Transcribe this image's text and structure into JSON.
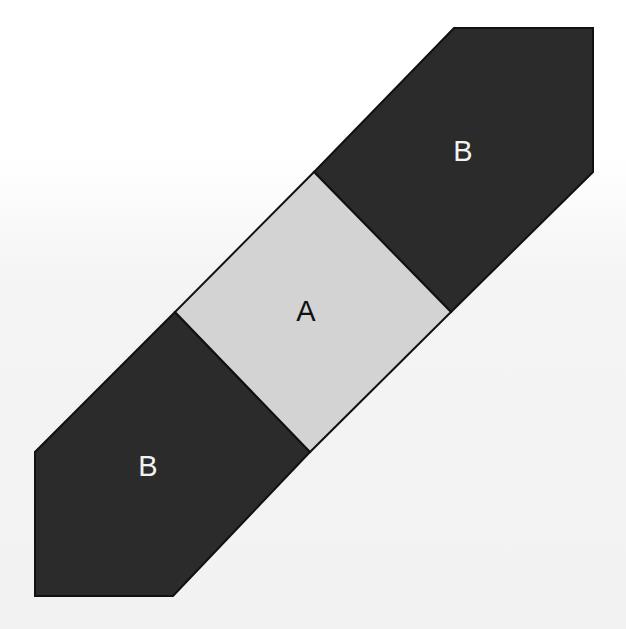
{
  "diagram": {
    "colors": {
      "background": "#f5f5f5",
      "square_fill": "#d3d3d3",
      "pentagon_fill": "#2b2b2b",
      "stroke": "#111111",
      "label_on_light": "#111111",
      "label_on_dark": "#f2f2f2"
    },
    "shapes": [
      {
        "id": "square-a",
        "type": "square",
        "label": "A",
        "points": "314,172 451,312 310,452 175,312",
        "label_pos": [
          306,
          321
        ]
      },
      {
        "id": "pentagon-b-upper",
        "type": "pentagon",
        "label": "B",
        "points": "454,28 593,28 593,172 451,312 314,172",
        "label_pos": [
          463,
          161
        ]
      },
      {
        "id": "pentagon-b-lower",
        "type": "pentagon",
        "label": "B",
        "points": "175,312 310,452 173,596 35,596 35,452",
        "label_pos": [
          148,
          476
        ]
      }
    ]
  }
}
